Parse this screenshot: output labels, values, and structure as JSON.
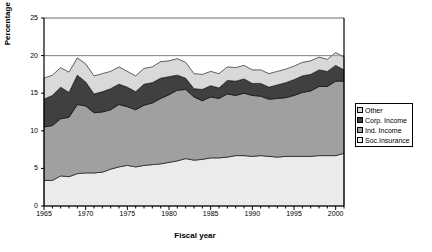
{
  "chart_data": {
    "type": "area",
    "title": "",
    "xlabel": "Fiscal year",
    "ylabel": "Percentage of GDP",
    "xlim": [
      1965,
      2001
    ],
    "ylim": [
      0,
      25
    ],
    "grid": true,
    "legend_position": "right",
    "stacked": true,
    "xticks": [
      "1965",
      "1970",
      "1975",
      "1980",
      "1985",
      "1990",
      "1995",
      "2000"
    ],
    "xtick_values": [
      1965,
      1970,
      1975,
      1980,
      1985,
      1990,
      1995,
      2000
    ],
    "yticks": [
      "0",
      "5",
      "10",
      "15",
      "20",
      "25"
    ],
    "ytick_values": [
      0,
      5,
      10,
      15,
      20,
      25
    ],
    "x": [
      1965,
      1966,
      1967,
      1968,
      1969,
      1970,
      1971,
      1972,
      1973,
      1974,
      1975,
      1976,
      1977,
      1978,
      1979,
      1980,
      1981,
      1982,
      1983,
      1984,
      1985,
      1986,
      1987,
      1988,
      1989,
      1990,
      1991,
      1992,
      1993,
      1994,
      1995,
      1996,
      1997,
      1998,
      1999,
      2000,
      2001
    ],
    "series": [
      {
        "name": "Soc.Insurance",
        "color": "#ebebeb",
        "values": [
          3.4,
          3.4,
          4.0,
          3.9,
          4.3,
          4.4,
          4.4,
          4.5,
          4.9,
          5.2,
          5.4,
          5.2,
          5.4,
          5.5,
          5.6,
          5.8,
          6.0,
          6.3,
          6.1,
          6.2,
          6.4,
          6.4,
          6.5,
          6.7,
          6.7,
          6.6,
          6.7,
          6.6,
          6.5,
          6.6,
          6.6,
          6.6,
          6.6,
          6.7,
          6.7,
          6.7,
          7.0
        ]
      },
      {
        "name": "Ind. Income",
        "color": "#a0a0a0",
        "values": [
          7.1,
          7.3,
          7.6,
          7.9,
          9.2,
          8.9,
          8.0,
          8.0,
          7.9,
          8.3,
          7.8,
          7.6,
          8.0,
          8.2,
          8.7,
          9.0,
          9.4,
          9.2,
          8.4,
          7.8,
          8.1,
          7.9,
          8.4,
          8.0,
          8.3,
          8.1,
          7.9,
          7.6,
          7.8,
          7.8,
          8.1,
          8.5,
          8.7,
          9.2,
          9.2,
          9.9,
          9.6
        ]
      },
      {
        "name": "Corp. Income",
        "color": "#404040",
        "values": [
          3.7,
          4.0,
          4.2,
          3.3,
          3.9,
          3.2,
          2.5,
          2.7,
          2.8,
          2.7,
          2.6,
          2.4,
          2.8,
          2.7,
          2.7,
          2.4,
          2.0,
          1.5,
          1.1,
          1.5,
          1.5,
          1.4,
          1.8,
          1.9,
          1.9,
          1.6,
          1.7,
          1.6,
          1.8,
          2.0,
          2.1,
          2.2,
          2.2,
          2.2,
          2.0,
          2.1,
          1.5
        ]
      },
      {
        "name": "Other",
        "color": "#d9d9d9",
        "values": [
          2.8,
          2.7,
          2.6,
          2.7,
          2.3,
          2.4,
          2.4,
          2.4,
          2.3,
          2.3,
          2.1,
          2.1,
          2.1,
          2.1,
          2.2,
          2.1,
          2.2,
          2.1,
          2.0,
          2.0,
          1.9,
          1.9,
          1.8,
          1.8,
          1.8,
          1.8,
          1.8,
          1.8,
          1.8,
          1.8,
          1.8,
          1.8,
          1.8,
          1.7,
          1.6,
          1.7,
          1.7
        ]
      }
    ],
    "legend": [
      {
        "label": "Other",
        "color": "#d9d9d9"
      },
      {
        "label": "Corp. Income",
        "color": "#404040"
      },
      {
        "label": "Ind. Income",
        "color": "#a0a0a0"
      },
      {
        "label": "Soc.Insurance",
        "color": "#ebebeb"
      }
    ]
  }
}
